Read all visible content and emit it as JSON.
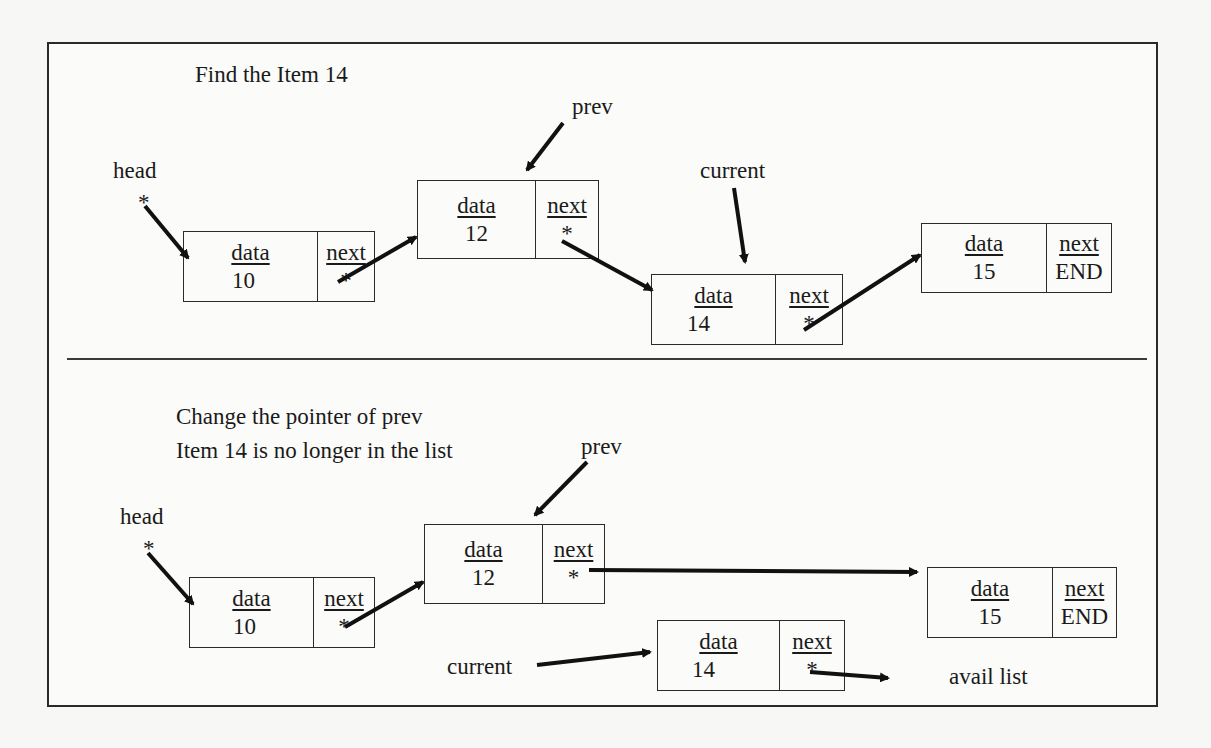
{
  "top_panel": {
    "title": "Find the Item 14",
    "pointers": {
      "head": "head",
      "prev": "prev",
      "current": "current",
      "star": "*"
    },
    "nodes": [
      {
        "data_label": "data",
        "next_label": "next",
        "value": "10",
        "next_value": "*"
      },
      {
        "data_label": "data",
        "next_label": "next",
        "value": "12",
        "next_value": "*"
      },
      {
        "data_label": "data",
        "next_label": "next",
        "value": "14",
        "next_value": "*"
      },
      {
        "data_label": "data",
        "next_label": "next",
        "value": "15",
        "next_value": "END"
      }
    ]
  },
  "bottom_panel": {
    "title_line1": "Change the pointer of prev",
    "title_line2": "Item 14 is no longer in the list",
    "pointers": {
      "head": "head",
      "prev": "prev",
      "current": "current",
      "star": "*",
      "avail": "avail list"
    },
    "nodes": [
      {
        "data_label": "data",
        "next_label": "next",
        "value": "10",
        "next_value": "*"
      },
      {
        "data_label": "data",
        "next_label": "next",
        "value": "12",
        "next_value": "*"
      },
      {
        "data_label": "data",
        "next_label": "next",
        "value": "15",
        "next_value": "END"
      },
      {
        "data_label": "data",
        "next_label": "next",
        "value": "14",
        "next_value": "*"
      }
    ]
  }
}
